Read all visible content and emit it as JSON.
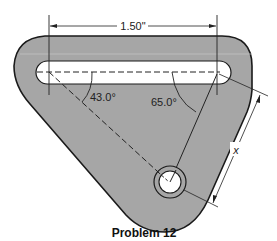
{
  "figure": {
    "caption": "Problem 12",
    "dimension_width": "1.50\"",
    "angle_left": "43.0°",
    "angle_right": "65.0°",
    "dimension_x": "x"
  },
  "colors": {
    "plate_fill": "#a6a6a6",
    "outline": "#1a1a1a",
    "background": "#ffffff"
  }
}
